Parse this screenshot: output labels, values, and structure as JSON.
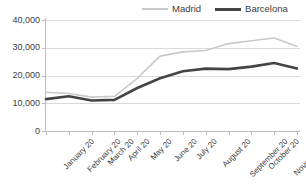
{
  "chart_data": {
    "type": "line",
    "title": "",
    "xlabel": "",
    "ylabel": "",
    "categories": [
      "January 20",
      "February 20",
      "March 20",
      "April 20",
      "May 20",
      "June 20",
      "July 20",
      "August 20",
      "September 20",
      "October 20",
      "November 20",
      "December 20"
    ],
    "series": [
      {
        "name": "Madrid",
        "color": "#c9c9c9",
        "values": [
          14000,
          13500,
          12200,
          12500,
          19000,
          27000,
          28500,
          29000,
          31500,
          32500,
          33500,
          30500
        ]
      },
      {
        "name": "Barcelona",
        "color": "#444444",
        "values": [
          11500,
          12500,
          11000,
          11200,
          15500,
          19000,
          21500,
          22500,
          22300,
          23200,
          24500,
          22500
        ]
      }
    ],
    "ylim": [
      0,
      40000
    ],
    "yticks": [
      0,
      10000,
      20000,
      30000,
      40000
    ],
    "ytick_labels": [
      "0",
      "10,000",
      "20,000",
      "30,000",
      "40,000"
    ],
    "grid": true,
    "legend_position": "top-right"
  },
  "legend": {
    "items": [
      {
        "label": "Madrid",
        "swatch": "line-swatch-light"
      },
      {
        "label": "Barcelona",
        "swatch": "line-swatch-dark"
      }
    ]
  },
  "colors": {
    "madrid": "#c9c9c9",
    "barcelona": "#444444",
    "grid": "#d9d9d9",
    "axis": "#bfbfbf",
    "text": "#3d3d3d",
    "background": "#ffffff"
  }
}
